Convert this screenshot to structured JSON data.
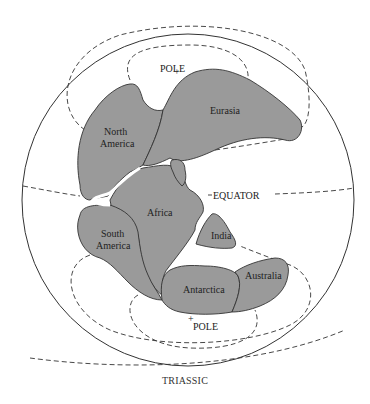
{
  "diagram": {
    "caption": "TRIASSIC",
    "colors": {
      "land": "#9a9a9a",
      "outline": "#333333",
      "background": "#ffffff"
    },
    "labels": {
      "north_pole": "POLE",
      "south_pole": "POLE",
      "equator": "EQUATOR",
      "eurasia": "Eurasia",
      "north_america_1": "North",
      "north_america_2": "America",
      "africa": "Africa",
      "south_america_1": "South",
      "south_america_2": "America",
      "india": "India",
      "antarctica": "Antarctica",
      "australia": "Australia"
    }
  }
}
